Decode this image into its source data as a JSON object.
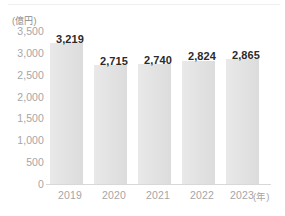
{
  "chart_data": {
    "type": "bar",
    "title": "",
    "subtitle": "",
    "xlabel": "(年)",
    "ylabel": "(億円)",
    "categories": [
      "2019",
      "2020",
      "2021",
      "2022",
      "2023"
    ],
    "values": [
      3219,
      2740,
      2740,
      2824,
      2865
    ],
    "value_labels": [
      "3,219",
      "2,715",
      "2,740",
      "2,824",
      "2,865"
    ],
    "series": [
      {
        "name": "",
        "values": [
          3219,
          2715,
          2740,
          2824,
          2865
        ]
      }
    ],
    "ylim": [
      0,
      3500
    ],
    "yticks": [
      0,
      500,
      1000,
      1500,
      2000,
      2500,
      3000,
      3500
    ],
    "ytick_labels": [
      "0",
      "500",
      "1,000",
      "1,500",
      "2,000",
      "2,500",
      "3,000",
      "3,500"
    ],
    "grid": false,
    "legend": null,
    "legend_position": "none",
    "annotations": [],
    "colors": {
      "bar_fill_light": "#e9e9e9",
      "bar_fill_dark": "#dcdcdc",
      "axis_line": "#d8d8d8",
      "tick_text": "#a6a6a6",
      "value_text": "#2b2b2b",
      "background": "#ffffff",
      "top_rule": "#f0f0f1"
    }
  },
  "axes": {
    "y_unit_label": "(億円)",
    "x_unit_label": "(年)"
  }
}
